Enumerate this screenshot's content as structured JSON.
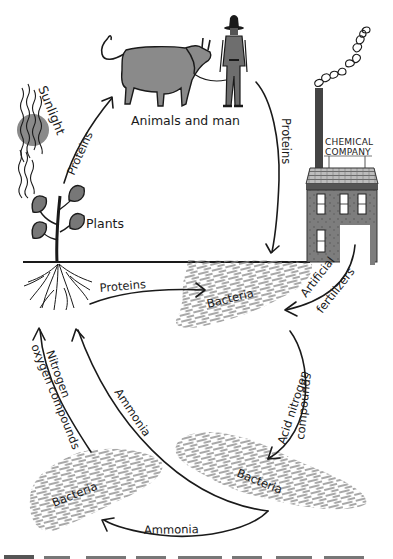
{
  "diagram": {
    "type": "nitrogen-cycle-illustration",
    "colors": {
      "ink": "#1a1a1a",
      "fill_gray": "#8a8a8a",
      "bacteria_gray": "#8c8c8c",
      "background": "#ffffff"
    },
    "nodes": {
      "sun": {
        "label": "Sunlight"
      },
      "plants": {
        "label": "Plants"
      },
      "animals": {
        "label": "Animals and man"
      },
      "factory": {
        "sign_line1": "CHEMICAL",
        "sign_line2": "COMPANY"
      },
      "bacteria_soil": {
        "label": "Bacteria"
      },
      "bacteria_left": {
        "label": "Bacteria"
      },
      "bacteria_right": {
        "label": "Bacteria"
      }
    },
    "edges": [
      {
        "id": "plants-to-animals",
        "label": "Proteins"
      },
      {
        "id": "animals-to-bacteria",
        "label": "Proteins"
      },
      {
        "id": "plants-to-bacteria",
        "label": "Proteins"
      },
      {
        "id": "factory-to-bacteria",
        "label_line1": "Artificial",
        "label_line2": "fertilizers"
      },
      {
        "id": "bacteria-to-right-bacteria",
        "label_line1": "Acid nitrogen",
        "label_line2": "compounds"
      },
      {
        "id": "right-bacteria-to-plants",
        "label": "Ammonia"
      },
      {
        "id": "right-bacteria-to-left-bacteria",
        "label": "Ammonia"
      },
      {
        "id": "left-bacteria-to-plants",
        "label_line1": "Nitrogen",
        "label_line2": "oxygen compounds"
      }
    ]
  }
}
